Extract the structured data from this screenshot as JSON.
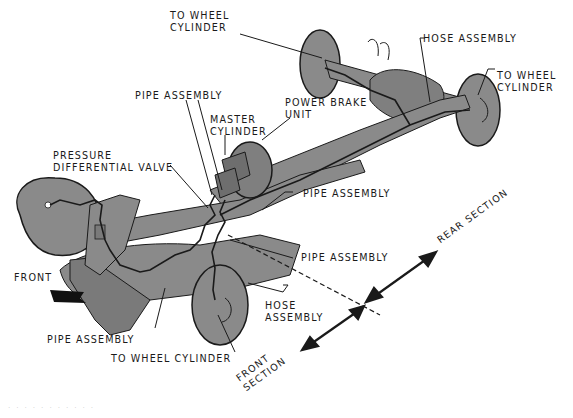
{
  "diagram": {
    "colors": {
      "background": "#ffffff",
      "chassis_fill": "#8a8a8a",
      "chassis_shade": "#6e6e6e",
      "outline": "#1a1a1a",
      "label_text": "#1a1a1a"
    },
    "labels": {
      "to_wheel_cylinder_rear_left": [
        "TO WHEEL",
        "CYLINDER"
      ],
      "hose_assembly_rear": "HOSE ASSEMBLY",
      "to_wheel_cylinder_rear_right": [
        "TO WHEEL",
        "CYLINDER"
      ],
      "pipe_assembly_top": "PIPE ASSEMBLY",
      "power_brake_unit": [
        "POWER BRAKE",
        "UNIT"
      ],
      "master_cylinder": [
        "MASTER",
        "CYLINDER"
      ],
      "pressure_differential_valve": [
        "PRESSURE",
        "DIFFERENTIAL VALVE"
      ],
      "pipe_assembly_right_1": "PIPE ASSEMBLY",
      "pipe_assembly_right_2": "PIPE ASSEMBLY",
      "rear_section": "REAR SECTION",
      "front": "FRONT",
      "hose_assembly_front": [
        "HOSE",
        "ASSEMBLY"
      ],
      "pipe_assembly_bottom": "PIPE ASSEMBLY",
      "to_wheel_cylinder_front": "TO WHEEL CYLINDER",
      "front_section": [
        "FRONT",
        "SECTION"
      ]
    },
    "caption": "· · ·  · ·  · · ·  · · ·"
  }
}
